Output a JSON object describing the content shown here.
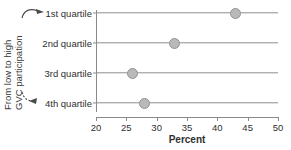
{
  "chart_data": {
    "type": "scatter",
    "orientation": "horizontal",
    "title": "",
    "subtitle": "",
    "xlabel": "Percent",
    "ylabel": "",
    "categories": [
      "1st quartile",
      "2nd quartile",
      "3rd quartile",
      "4th quartile"
    ],
    "values": [
      43,
      33,
      26,
      28
    ],
    "xlim": [
      20,
      50
    ],
    "xticks": [
      20,
      25,
      30,
      35,
      40,
      45,
      50
    ],
    "xticklabels": [
      "20",
      "25",
      "30",
      "35",
      "40",
      "45",
      "50"
    ],
    "grid": false,
    "legend": null,
    "marker": "filled-circle",
    "points": [
      {
        "category": "1st quartile",
        "value": 43
      },
      {
        "category": "2nd quartile",
        "value": 33
      },
      {
        "category": "3rd quartile",
        "value": 26
      },
      {
        "category": "4th quartile",
        "value": 28
      }
    ],
    "annotations": [
      {
        "text": "From low to high",
        "orientation": "vertical"
      },
      {
        "text": "GVC participation",
        "orientation": "vertical"
      }
    ]
  },
  "axis_annotation": {
    "line1": "From low to high",
    "line2": "GVC participation",
    "top_arrow_target": "1st quartile",
    "bottom_arrow_target": "4th quartile"
  },
  "colors": {
    "marker_fill": "#b9b9b9",
    "marker_stroke": "#949494",
    "axis": "#8a8a8a",
    "rowline": "#8f8f8f",
    "text": "#2f2f2f",
    "background": "#ffffff"
  }
}
